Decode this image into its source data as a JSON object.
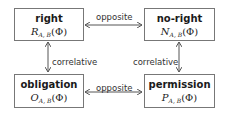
{
  "nodes": {
    "right": {
      "title": "right",
      "var": "R",
      "sub": "A, B",
      "arg": "(Φ)"
    },
    "no_right": {
      "title": "no-right",
      "var": "N",
      "sub": "A, B",
      "arg": "(Φ)"
    },
    "obligation": {
      "title": "obligation",
      "var": "O",
      "sub": "A, B",
      "arg": "(Φ)"
    },
    "permission": {
      "title": "permission",
      "var": "P",
      "sub": "A, B",
      "arg": "(Φ)"
    }
  },
  "edges": {
    "top": "opposite",
    "bottom": "opposite",
    "left": "correlative",
    "right": "correlative"
  },
  "colors": {
    "border": "#777777",
    "arrow": "#555555",
    "text": "#222222"
  }
}
